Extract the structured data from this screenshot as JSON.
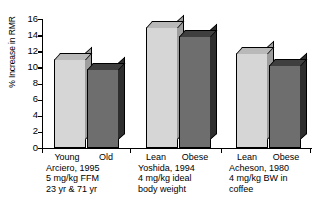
{
  "chart_data": {
    "type": "bar",
    "title": "",
    "xlabel": "",
    "ylabel": "% Increase in RMR",
    "ylim": [
      0,
      16
    ],
    "yticks": [
      0,
      2,
      4,
      6,
      8,
      10,
      12,
      14,
      16
    ],
    "grid": false,
    "legend": "none",
    "style": "3d-bars-grayscale",
    "colors": {
      "light_bar": "#d6d6d6",
      "dark_bar": "#6e6e6e",
      "axis": "#000000",
      "background": "#ffffff"
    },
    "categories": [
      "Young",
      "Old",
      "Lean",
      "Obese",
      "Lean",
      "Obese"
    ],
    "values": [
      11.0,
      9.8,
      15.0,
      13.9,
      11.8,
      10.3
    ],
    "groups": [
      {
        "id": "arciero-1995",
        "bars": [
          {
            "label": "Young",
            "value": 11.0,
            "shade": "light"
          },
          {
            "label": "Old",
            "value": 9.8,
            "shade": "dark"
          }
        ],
        "caption": [
          "Arciero, 1995",
          "5 mg/kg FFM",
          "23 yr & 71 yr"
        ]
      },
      {
        "id": "yoshida-1994",
        "bars": [
          {
            "label": "Lean",
            "value": 15.0,
            "shade": "light"
          },
          {
            "label": "Obese",
            "value": 13.9,
            "shade": "dark"
          }
        ],
        "caption": [
          "Yoshida, 1994",
          "4 mg/kg ideal",
          "body weight"
        ]
      },
      {
        "id": "acheson-1980",
        "bars": [
          {
            "label": "Lean",
            "value": 11.8,
            "shade": "light"
          },
          {
            "label": "Obese",
            "value": 10.3,
            "shade": "dark"
          }
        ],
        "caption": [
          "Acheson, 1980",
          "4 mg/kg BW in",
          "coffee"
        ]
      }
    ]
  },
  "axis": {
    "y": {
      "title": "% Increase in RMR",
      "ticks": [
        "16",
        "14",
        "12",
        "10",
        "8",
        "6",
        "4",
        "2",
        "0"
      ]
    }
  },
  "groups": {
    "g0": {
      "cat0": "Young",
      "cat1": "Old",
      "line0": "Arciero, 1995",
      "line1": "5 mg/kg FFM",
      "line2": "23 yr & 71 yr"
    },
    "g1": {
      "cat0": "Lean",
      "cat1": "Obese",
      "line0": "Yoshida, 1994",
      "line1": "4 mg/kg ideal",
      "line2": "body weight"
    },
    "g2": {
      "cat0": "Lean",
      "cat1": "Obese",
      "line0": "Acheson, 1980",
      "line1": "4 mg/kg BW in",
      "line2": "coffee"
    }
  }
}
